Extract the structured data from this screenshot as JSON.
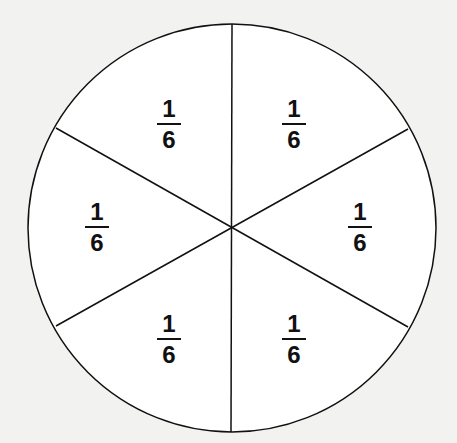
{
  "diagram": {
    "title": "",
    "type": "circle divided into six equal sectors",
    "colors": {
      "background": "#f2f2f0",
      "stroke": "#111111",
      "fill": "#ffffff"
    },
    "sectors": [
      {
        "numerator": "1",
        "denominator": "6",
        "x": 169,
        "y": 96
      },
      {
        "numerator": "1",
        "denominator": "6",
        "x": 294,
        "y": 96
      },
      {
        "numerator": "1",
        "denominator": "6",
        "x": 97,
        "y": 199
      },
      {
        "numerator": "1",
        "denominator": "6",
        "x": 360,
        "y": 199
      },
      {
        "numerator": "1",
        "denominator": "6",
        "x": 169,
        "y": 311
      },
      {
        "numerator": "1",
        "denominator": "6",
        "x": 294,
        "y": 311
      }
    ]
  }
}
